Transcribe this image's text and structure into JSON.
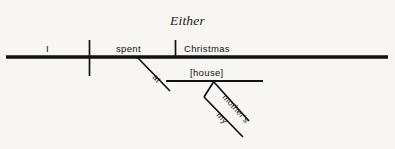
{
  "diagram": {
    "type": "reed-kellogg-sentence-diagram",
    "title": "Either",
    "sentence": "Either I spent Christmas at [house] mother's my",
    "ink_color": "#111111",
    "background_color": "#f7f6f2",
    "baseline": {
      "label": "main-baseline",
      "x1": 6,
      "x2": 388,
      "y": 57
    },
    "nodes": [
      {
        "id": "subject",
        "label": "I",
        "role": "subject",
        "x": 46,
        "y": 52
      },
      {
        "id": "verb",
        "label": "spent",
        "role": "verb",
        "x": 116,
        "y": 52
      },
      {
        "id": "object",
        "label": "Christmas",
        "role": "direct-object",
        "x": 184,
        "y": 52
      },
      {
        "id": "preposition",
        "label": "at",
        "role": "preposition",
        "x": 154,
        "y": 78
      },
      {
        "id": "prep-object",
        "label": "[house]",
        "role": "object-of-preposition",
        "x": 190,
        "y": 77
      },
      {
        "id": "possessive",
        "label": "mother's",
        "role": "possessive-modifier",
        "x": 221,
        "y": 97
      },
      {
        "id": "determiner",
        "label": "my",
        "role": "possessive-determiner",
        "x": 215,
        "y": 114
      }
    ],
    "dividers": [
      {
        "id": "subject-verb-divider",
        "kind": "full-vertical",
        "x": 89,
        "y1": 40,
        "y2": 76
      },
      {
        "id": "verb-object-divider",
        "kind": "half-vertical",
        "x": 175,
        "y1": 40,
        "y2": 57
      }
    ],
    "connectors": [
      {
        "id": "prep-slant",
        "kind": "diagonal",
        "x1": 137,
        "y1": 57,
        "x2": 170,
        "y2": 91
      },
      {
        "id": "prep-object-line",
        "kind": "horizontal",
        "x1": 166,
        "y1": 81,
        "x2": 263,
        "y2": 81
      },
      {
        "id": "possessive-slant",
        "kind": "diagonal",
        "x1": 213,
        "y1": 81,
        "x2": 249,
        "y2": 121
      },
      {
        "id": "determiner-bracket",
        "kind": "diagonal",
        "x1": 213,
        "y1": 82,
        "x2": 204,
        "y2": 97
      },
      {
        "id": "determiner-slant",
        "kind": "diagonal",
        "x1": 204,
        "y1": 97,
        "x2": 243,
        "y2": 137
      }
    ]
  }
}
